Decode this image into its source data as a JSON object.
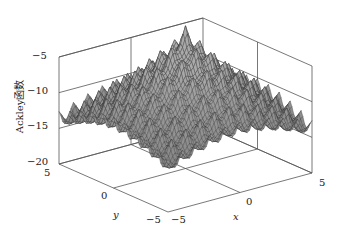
{
  "chart_data": {
    "type": "surface",
    "title": "",
    "function": "-Ackley(x,y)",
    "xlabel": "x",
    "ylabel": "y",
    "zlabel": "Ackley函数",
    "xlim": [
      -5,
      5
    ],
    "ylim": [
      -5,
      5
    ],
    "zlim": [
      -20,
      -5
    ],
    "x_ticks": [
      "-5",
      "0",
      "5"
    ],
    "y_ticks": [
      "-5",
      "0",
      "5"
    ],
    "z_ticks": [
      "-5",
      "-10",
      "-15",
      "-20"
    ],
    "grid": true,
    "minimum": {
      "x": 0,
      "y": 0,
      "z": -20
    },
    "mesh_color": "#333333",
    "face_color": "#9a9a9a",
    "frame_color": "#555555"
  },
  "labels": {
    "z_axis": "Ackley函数",
    "x_axis": "x",
    "y_axis": "y",
    "z5": "−5",
    "z10": "−10",
    "z15": "−15",
    "z20": "−20",
    "y5": "5",
    "y0": "0",
    "ym5": "−5",
    "xm5": "−5",
    "x0": "0",
    "x5": "5"
  }
}
